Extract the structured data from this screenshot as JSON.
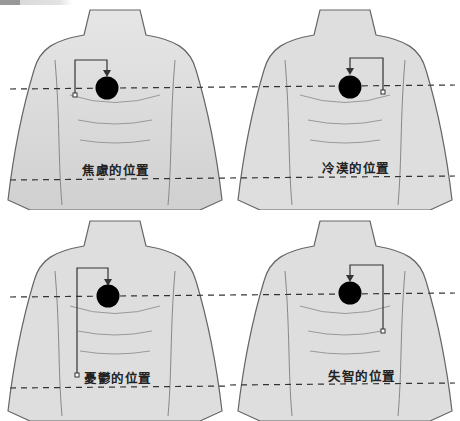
{
  "figure": {
    "colors": {
      "marker": "#000000",
      "line": "#333333",
      "skin": "#d9d9d9",
      "outline": "#555555"
    }
  },
  "panels": [
    {
      "label": "焦慮的位置",
      "position": "top-left",
      "marker_side": "left",
      "start_y": "chest"
    },
    {
      "label": "冷漠的位置",
      "position": "top-right",
      "marker_side": "right",
      "start_y": "chest"
    },
    {
      "label": "憂鬱的位置",
      "position": "bottom-left",
      "marker_side": "left",
      "start_y": "abdomen"
    },
    {
      "label": "失智的位置",
      "position": "bottom-right",
      "marker_side": "right",
      "start_y": "upper-abdomen"
    }
  ]
}
